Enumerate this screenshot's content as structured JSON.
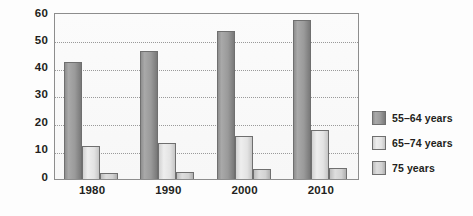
{
  "chart_data": {
    "type": "bar",
    "title": "",
    "xlabel": "",
    "ylabel": "",
    "categories": [
      "1980",
      "1990",
      "2000",
      "2010"
    ],
    "series": [
      {
        "name": "55–64 years",
        "values": [
          42,
          46,
          53,
          57
        ],
        "color": "#9a9a9a"
      },
      {
        "name": "65–74 years",
        "values": [
          12,
          13,
          15.5,
          17.5
        ],
        "color": "#e3e3e3"
      },
      {
        "name": "75 years",
        "values": [
          2,
          2.5,
          3.5,
          4
        ],
        "color": "#d2d2d2"
      }
    ],
    "ylim": [
      0,
      60
    ],
    "yticks": [
      0,
      10,
      20,
      30,
      40,
      50,
      60
    ],
    "ytick_labels": [
      "0",
      "10",
      "20",
      "30",
      "40",
      "50",
      "60"
    ],
    "grid": true,
    "grid_axis": "y",
    "legend_position": "right"
  },
  "legend": {
    "entries": [
      {
        "label": "55–64 years"
      },
      {
        "label": "65–74 years"
      },
      {
        "label": "75 years"
      }
    ]
  },
  "axes": {
    "y_labels": [
      "60",
      "50",
      "40",
      "30",
      "20",
      "10",
      "0"
    ],
    "x_labels": [
      "1980",
      "1990",
      "2000",
      "2010"
    ]
  },
  "colors": {
    "frame": "#8d8d8d",
    "gridline": "#9a9a9a",
    "text": "#231f20",
    "background": "#fdfdfd"
  }
}
